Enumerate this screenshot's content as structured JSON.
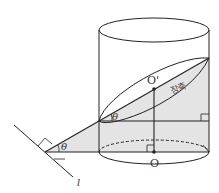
{
  "figure": {
    "labels": {
      "top_center": "O'",
      "bottom_center": "O",
      "major_axis": "장축",
      "angle_upper": "θ",
      "angle_lower": "θ",
      "line": "l"
    },
    "colors": {
      "stroke": "#222222",
      "shade": "#e3e3e3",
      "background": "#ffffff"
    }
  }
}
